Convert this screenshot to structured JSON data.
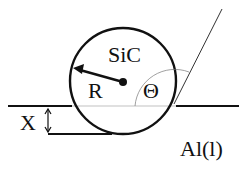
{
  "diagram": {
    "particle_label": "SiC",
    "radius_label": "R",
    "angle_label": "Θ",
    "depth_label": "X",
    "liquid_label": "Al(l)"
  }
}
